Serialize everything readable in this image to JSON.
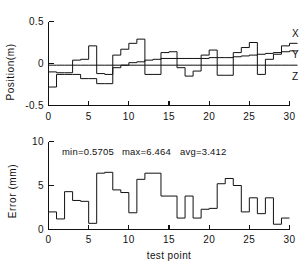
{
  "figure": {
    "name": "two-panel-step-plot",
    "background": "#ffffff",
    "ink_color": "#111111"
  },
  "chart_data": [
    {
      "id": "position-chart",
      "type": "line",
      "subtype": "step",
      "title": "",
      "xlabel": "",
      "ylabel": "Position(m)",
      "xlim": [
        0,
        30
      ],
      "ylim": [
        -0.5,
        0.5
      ],
      "xticks": [
        0,
        5,
        10,
        15,
        20,
        25,
        30
      ],
      "xtick_labels": [
        "0",
        "5",
        "10",
        "15",
        "20",
        "25",
        "30"
      ],
      "yticks": [
        -0.5,
        0,
        0.5
      ],
      "ytick_labels": [
        "-0.5",
        "0",
        "0.5"
      ],
      "grid": false,
      "legend_position": "right-inline",
      "legend": [
        "X",
        "Y",
        "Z"
      ],
      "x": [
        0,
        1,
        2,
        3,
        4,
        5,
        6,
        7,
        8,
        9,
        10,
        11,
        12,
        13,
        14,
        15,
        16,
        17,
        18,
        19,
        20,
        21,
        22,
        23,
        24,
        25,
        26,
        27,
        28,
        29,
        30
      ],
      "series": [
        {
          "name": "X",
          "label": "X",
          "values": [
            -0.1,
            -0.11,
            -0.11,
            0.04,
            0.05,
            0.21,
            -0.12,
            -0.13,
            0.1,
            0.17,
            0.24,
            0.29,
            -0.13,
            -0.13,
            0.13,
            0.14,
            -0.05,
            -0.15,
            -0.09,
            0.1,
            0.16,
            -0.14,
            -0.14,
            0.13,
            0.19,
            0.25,
            -0.13,
            0.05,
            0.11,
            0.21,
            0.24
          ]
        },
        {
          "name": "Y",
          "label": "Y",
          "values": [
            -0.28,
            -0.13,
            -0.13,
            -0.13,
            -0.18,
            -0.18,
            -0.24,
            -0.24,
            -0.05,
            -0.02,
            0.01,
            0.02,
            0.04,
            0.05,
            0.06,
            0.06,
            0.06,
            0.06,
            0.06,
            0.06,
            0.07,
            0.07,
            0.07,
            0.08,
            0.09,
            0.1,
            0.11,
            0.12,
            0.13,
            0.14,
            0.15
          ]
        },
        {
          "name": "Z",
          "label": "Z",
          "values": [
            -0.02,
            -0.02,
            -0.02,
            -0.02,
            -0.02,
            -0.02,
            -0.02,
            -0.02,
            -0.02,
            -0.02,
            -0.02,
            -0.02,
            -0.02,
            -0.02,
            -0.02,
            -0.02,
            -0.02,
            -0.02,
            -0.02,
            -0.02,
            -0.02,
            -0.02,
            -0.02,
            -0.02,
            -0.02,
            -0.02,
            -0.02,
            -0.02,
            -0.02,
            -0.02,
            -0.02
          ]
        }
      ]
    },
    {
      "id": "error-chart",
      "type": "line",
      "subtype": "step",
      "title": "",
      "xlabel": "test point",
      "ylabel": "Error (mm)",
      "xlim": [
        0,
        30
      ],
      "ylim": [
        0,
        10
      ],
      "xticks": [
        0,
        5,
        10,
        15,
        20,
        25,
        30
      ],
      "xtick_labels": [
        "0",
        "5",
        "10",
        "15",
        "20",
        "25",
        "30"
      ],
      "yticks": [
        0,
        5,
        10
      ],
      "ytick_labels": [
        "0",
        "5",
        "10"
      ],
      "grid": false,
      "annotations": {
        "min_label": "min=0.5705",
        "max_label": "max=6.464",
        "avg_label": "avg=3.412",
        "min_value": 0.5705,
        "max_value": 6.464,
        "avg_value": 3.412
      },
      "x": [
        0,
        1,
        2,
        3,
        4,
        5,
        6,
        7,
        8,
        9,
        10,
        11,
        12,
        13,
        14,
        15,
        16,
        17,
        18,
        19,
        20,
        21,
        22,
        23,
        24,
        25,
        26,
        27,
        28,
        29
      ],
      "series": [
        {
          "name": "Error",
          "label": "Error",
          "values": [
            2.0,
            1.2,
            4.3,
            3.3,
            3.2,
            0.7,
            6.4,
            6.5,
            4.5,
            4.2,
            1.9,
            5.7,
            6.4,
            6.4,
            3.8,
            3.8,
            1.3,
            3.8,
            1.3,
            2.3,
            2.4,
            5.2,
            5.8,
            5.0,
            2.0,
            3.6,
            1.8,
            3.6,
            0.6,
            1.3
          ]
        }
      ]
    }
  ]
}
